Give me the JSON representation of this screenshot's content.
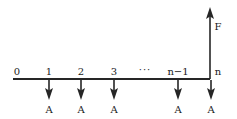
{
  "diagram": {
    "type": "cash-flow-timeline",
    "title": "",
    "axis": {
      "start_x": 13,
      "end_x": 210,
      "y": 79,
      "color": "#262626"
    },
    "periods": [
      {
        "label": "0",
        "x": 17,
        "has_payment": false
      },
      {
        "label": "1",
        "x": 49,
        "has_payment": true
      },
      {
        "label": "2",
        "x": 81,
        "has_payment": true
      },
      {
        "label": "3",
        "x": 114,
        "has_payment": true
      },
      {
        "label": "···",
        "x": 145,
        "has_payment": false
      },
      {
        "label": "n−1",
        "x": 178,
        "has_payment": true
      },
      {
        "label": "n",
        "x": 218,
        "has_payment": true
      }
    ],
    "payments": [
      {
        "label": "A",
        "x": 49,
        "direction": "down"
      },
      {
        "label": "A",
        "x": 81,
        "direction": "down"
      },
      {
        "label": "A",
        "x": 114,
        "direction": "down"
      },
      {
        "label": "A",
        "x": 178,
        "direction": "down"
      },
      {
        "label": "A",
        "x": 211,
        "direction": "down"
      }
    ],
    "future_value": {
      "label": "F",
      "x": 210,
      "label_x": 218,
      "label_y": 30,
      "top_y": 8,
      "direction": "up"
    },
    "colors": {
      "line": "#262626",
      "text": "#1a1a1a",
      "background": "#ffffff"
    }
  }
}
